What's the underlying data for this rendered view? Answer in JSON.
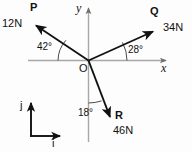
{
  "figure": {
    "origin_label": "O",
    "axes": {
      "x_label": "x",
      "y_label": "y"
    },
    "unit_vectors": {
      "i_label": "i",
      "j_label": "j"
    },
    "vectors": [
      {
        "name": "P",
        "magnitude": "12N",
        "angle": "42",
        "angle_unit": "°",
        "angle_label": "42°",
        "reference": "negative x-axis",
        "direction": "up-left"
      },
      {
        "name": "Q",
        "magnitude": "34N",
        "angle": "28",
        "angle_unit": "°",
        "angle_label": "28°",
        "reference": "positive x-axis",
        "direction": "up-right"
      },
      {
        "name": "R",
        "magnitude": "46N",
        "angle": "18",
        "angle_unit": "°",
        "angle_label": "18°",
        "reference": "negative y-axis",
        "direction": "down-right"
      }
    ],
    "colors": {
      "stroke": "#111111",
      "axis": "#a8a8a8",
      "background": "#fdfdfd"
    }
  }
}
